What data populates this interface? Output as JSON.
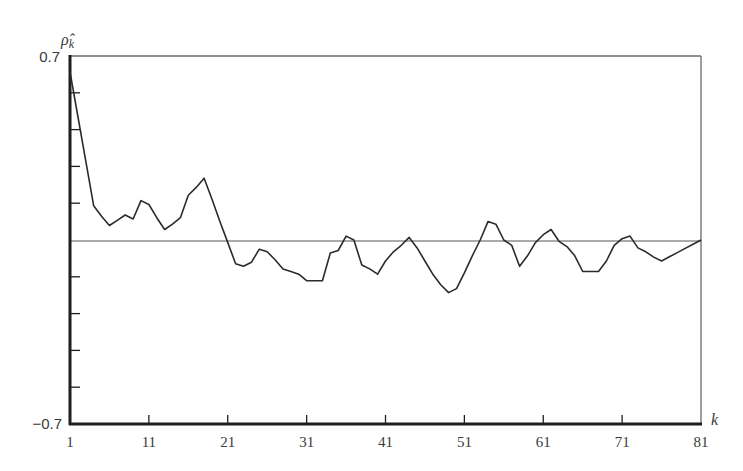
{
  "chart_data": {
    "type": "line",
    "title": "",
    "xlabel": "k",
    "ylabel": "ρ̂_k",
    "ylabel_main": "ρ̂",
    "ylabel_sub": "k",
    "xlim": [
      1,
      81
    ],
    "ylim": [
      -0.7,
      0.7
    ],
    "x_ticks": [
      1,
      11,
      21,
      31,
      41,
      51,
      61,
      71,
      81
    ],
    "x_tick_labels": [
      "1",
      "11",
      "21",
      "31",
      "41",
      "51",
      "61",
      "71",
      "81"
    ],
    "y_ticks": [
      -0.7,
      -0.56,
      -0.42,
      -0.28,
      -0.14,
      0,
      0.14,
      0.28,
      0.42,
      0.56,
      0.7
    ],
    "y_tick_labels": {
      "top": "0.7",
      "bottom": "−0.7"
    },
    "grid": false,
    "zero_line": true,
    "legend": null,
    "series": [
      {
        "name": "sample autocorrelation",
        "x": [
          1,
          2,
          3,
          4,
          5,
          6,
          7,
          8,
          9,
          10,
          11,
          12,
          13,
          14,
          15,
          16,
          17,
          18,
          19,
          20,
          21,
          22,
          23,
          24,
          25,
          26,
          27,
          28,
          29,
          30,
          31,
          32,
          33,
          34,
          35,
          36,
          37,
          38,
          39,
          40,
          41,
          42,
          43,
          44,
          45,
          46,
          47,
          48,
          49,
          50,
          51,
          52,
          53,
          54,
          55,
          56,
          57,
          58,
          59,
          60,
          61,
          62,
          63,
          64,
          65,
          66,
          67,
          68,
          69,
          70,
          71,
          72,
          73,
          74,
          75,
          76,
          77,
          78,
          79,
          80,
          81
        ],
        "values": [
          0.64,
          0.47,
          0.3,
          0.13,
          0.09,
          0.055,
          0.075,
          0.095,
          0.08,
          0.15,
          0.135,
          0.085,
          0.04,
          0.06,
          0.085,
          0.17,
          0.2,
          0.235,
          0.155,
          0.07,
          -0.01,
          -0.09,
          -0.1,
          -0.085,
          -0.035,
          -0.045,
          -0.075,
          -0.11,
          -0.12,
          -0.13,
          -0.155,
          -0.155,
          -0.155,
          -0.05,
          -0.04,
          0.015,
          0.0,
          -0.095,
          -0.11,
          -0.13,
          -0.08,
          -0.045,
          -0.02,
          0.01,
          -0.03,
          -0.08,
          -0.13,
          -0.17,
          -0.2,
          -0.185,
          -0.125,
          -0.06,
          0.0,
          0.07,
          0.06,
          0.0,
          -0.02,
          -0.1,
          -0.06,
          -0.01,
          0.02,
          0.04,
          -0.005,
          -0.025,
          -0.06,
          -0.12,
          -0.12,
          -0.12,
          -0.08,
          -0.02,
          0.005,
          0.015,
          -0.03,
          -0.045,
          -0.065,
          -0.08,
          -0.064,
          -0.048,
          -0.032,
          -0.016,
          0.0
        ]
      }
    ]
  },
  "colors": {
    "line": "#2b2b2b",
    "axis": "#1e1e1e",
    "frame": "#6a6a6a",
    "zero_line": "#555555",
    "background": "#ffffff"
  }
}
